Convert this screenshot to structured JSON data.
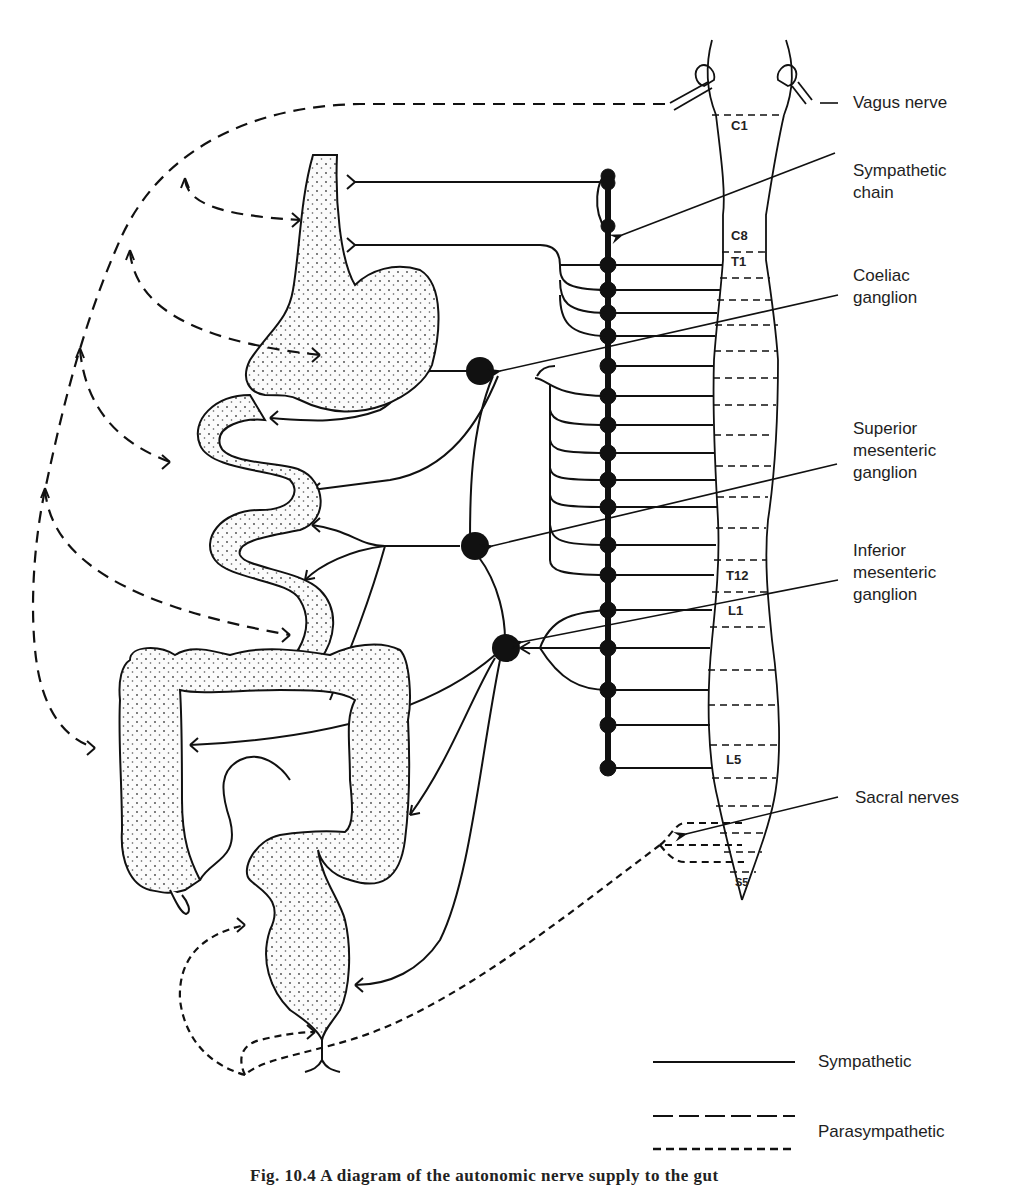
{
  "figure": {
    "caption": "Fig. 10.4 A diagram of the autonomic nerve supply to the gut"
  },
  "labels": {
    "vagus": "Vagus nerve",
    "sympathetic_chain": "Sympathetic\nchain",
    "coeliac": "Coeliac\nganglion",
    "superior_mesenteric": "Superior\nmesenteric\nganglion",
    "inferior_mesenteric": "Inferior\nmesenteric\nganglion",
    "sacral": "Sacral nerves"
  },
  "spinal_segments": {
    "c1": "C1",
    "c8": "C8",
    "t1": "T1",
    "t12": "T12",
    "l1": "L1",
    "l5": "L5",
    "s5": "S5"
  },
  "legend": {
    "items": [
      {
        "label": "Sympathetic",
        "style": "solid"
      },
      {
        "label": "Parasympathetic",
        "style": "long-dash / short-dash"
      }
    ]
  },
  "colors": {
    "ink": "#111111",
    "organ_fill": "#f4f4f4",
    "background": "#ffffff"
  }
}
